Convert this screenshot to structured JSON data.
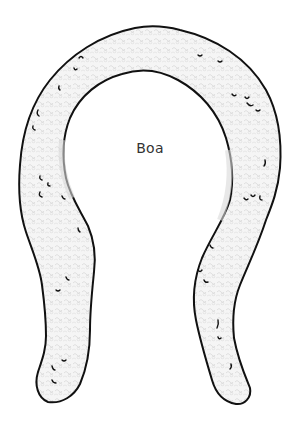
{
  "illustration": {
    "subject": "feather boa",
    "style": "line drawing with fluffy texture",
    "label": "Boa",
    "colors": {
      "background": "#ffffff",
      "outline": "#111111",
      "fill": "#f4f4f4",
      "texture": "#c8c8c8",
      "shading": "#d9d9d9",
      "label": "#333333"
    }
  }
}
